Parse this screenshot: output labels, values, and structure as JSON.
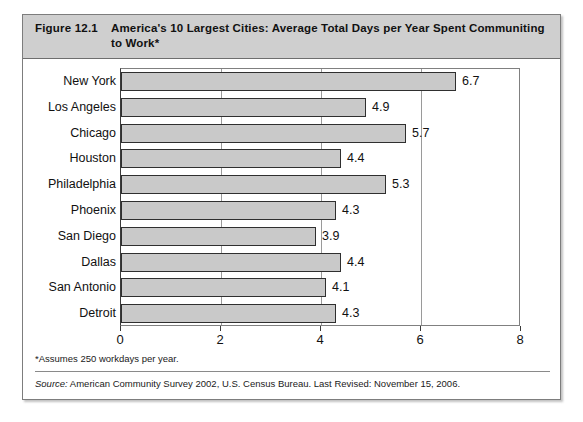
{
  "figure": {
    "number": "Figure 12.1",
    "title": "America's 10 Largest Cities: Average Total Days per Year Spent Communiting to Work*",
    "footnote": "*Assumes 250 workdays per year.",
    "source_label": "Source:",
    "source_text": " American Community Survey 2002, U.S. Census Bureau. Last Revised: November 15, 2006."
  },
  "colors": {
    "header_band": "#cfcfcf",
    "bar_fill": "#c9c9c9",
    "bar_border": "#2f2f2f",
    "axis": "#3a3a3a",
    "gridline": "#9a9a9a",
    "card_border": "#7d7d7d"
  },
  "chart_data": {
    "type": "bar",
    "orientation": "horizontal",
    "title": "America's 10 Largest Cities: Average Total Days per Year Spent Communiting to Work*",
    "xlabel": "",
    "ylabel": "",
    "xlim": [
      0,
      8
    ],
    "xticks": [
      0,
      2,
      4,
      6,
      8
    ],
    "xtick_labels": [
      "0",
      "2",
      "4",
      "6",
      "8"
    ],
    "grid": true,
    "grid_axis": "x",
    "legend": "none",
    "categories": [
      "New York",
      "Los Angeles",
      "Chicago",
      "Houston",
      "Philadelphia",
      "Phoenix",
      "San Diego",
      "Dallas",
      "San Antonio",
      "Detroit"
    ],
    "values": [
      6.7,
      4.9,
      5.7,
      4.4,
      5.3,
      4.3,
      3.9,
      4.4,
      4.1,
      4.3
    ],
    "value_labels": [
      "6.7",
      "4.9",
      "5.7",
      "4.4",
      "5.3",
      "4.3",
      "3.9",
      "4.4",
      "4.1",
      "4.3"
    ]
  }
}
